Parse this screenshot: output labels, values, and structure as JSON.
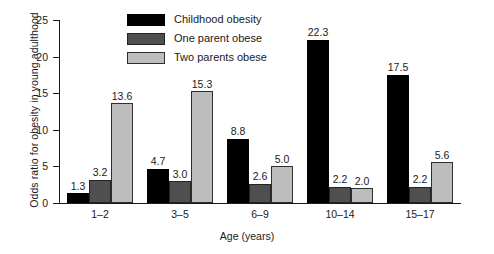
{
  "chart_data": {
    "type": "bar",
    "title": "",
    "subtitle": "",
    "xlabel": "Age (years)",
    "ylabel": "Odds ratio for obesity in young adulthood",
    "categories": [
      "1–2",
      "3–5",
      "6–9",
      "10–14",
      "15–17"
    ],
    "series": [
      {
        "name": "Childhood obesity",
        "color": "#000000",
        "values": [
          1.3,
          4.7,
          8.8,
          22.3,
          17.5
        ],
        "labels": [
          "1.3",
          "4.7",
          "8.8",
          "22.3",
          "17.5"
        ]
      },
      {
        "name": "One parent obese",
        "color": "#4f4f4f",
        "values": [
          3.2,
          3.0,
          2.6,
          2.2,
          2.2
        ],
        "labels": [
          "3.2",
          "3.0",
          "2.6",
          "2.2",
          "2.2"
        ]
      },
      {
        "name": "Two parents obese",
        "color": "#bdbdbd",
        "values": [
          13.6,
          15.3,
          5.0,
          2.0,
          5.6
        ],
        "labels": [
          "13.6",
          "15.3",
          "5.0",
          "2.0",
          "5.6"
        ]
      }
    ],
    "ylim": [
      0,
      25
    ],
    "yticks": [
      0,
      5,
      10,
      15,
      20,
      25
    ],
    "ytick_labels": [
      "0",
      "5",
      "10",
      "15",
      "20",
      "25"
    ],
    "grid": false,
    "legend_position": "upper center",
    "legend_entries": [
      "Childhood obesity",
      "One parent obese",
      "Two parents obese"
    ]
  }
}
